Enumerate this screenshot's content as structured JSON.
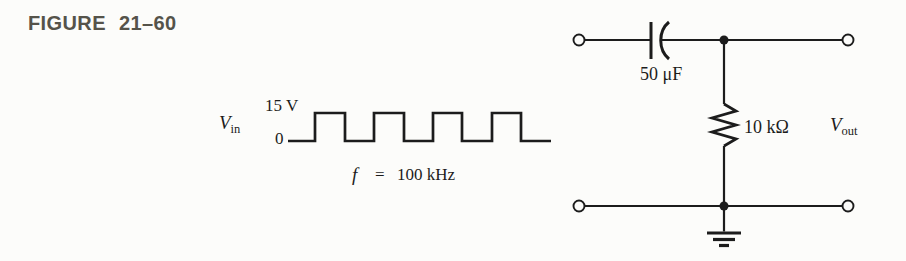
{
  "figure_label": "FIGURE 21–60",
  "waveform": {
    "source_label": {
      "main": "V",
      "sub": "in"
    },
    "high_level_label": "15 V",
    "low_level_label": "0",
    "frequency": {
      "symbol": "f",
      "equals": "=",
      "value": "100 kHz"
    },
    "shape": "square-wave",
    "high_v": 15,
    "low_v": 0,
    "pulses_shown": 4
  },
  "circuit": {
    "capacitor_value": "50 μF",
    "resistor_value": "10 kΩ",
    "output_label": {
      "main": "V",
      "sub": "out"
    }
  },
  "colors": {
    "ink": "#1c1c1c",
    "figure_label": "#55534a",
    "background": "#fcfcfa"
  }
}
